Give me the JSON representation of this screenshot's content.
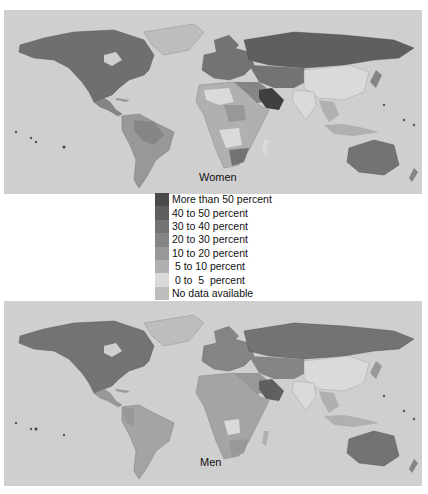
{
  "maps": [
    {
      "id": "women",
      "label": "Women"
    },
    {
      "id": "men",
      "label": "Men"
    }
  ],
  "legend": {
    "items": [
      {
        "label": "More than 50 percent",
        "color": "#4a4a4a"
      },
      {
        "label": "40 to 50 percent",
        "color": "#5f5f5f"
      },
      {
        "label": "30 to 40 percent",
        "color": "#737373"
      },
      {
        "label": "20 to 30 percent",
        "color": "#858585"
      },
      {
        "label": "10 to 20 percent",
        "color": "#989898"
      },
      {
        "label": " 5 to 10 percent",
        "color": "#b0b0b0"
      },
      {
        "label": " 0 to  5  percent",
        "color": "#dadada"
      },
      {
        "label": "No data available",
        "color": "#bdbdbd"
      }
    ]
  },
  "colors": {
    "ocean": "#cfcfcf",
    "no_data": "#bdbdbd"
  }
}
